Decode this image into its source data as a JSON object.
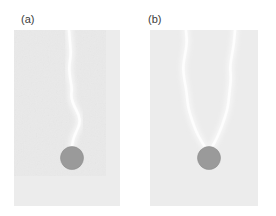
{
  "figure": {
    "width": 276,
    "height": 216,
    "background_color": "#ffffff"
  },
  "colors": {
    "page_background": "#ffffff",
    "specimen_body": "#ececec",
    "specimen_body_alt": "#e8e8e8",
    "crack_path": "#fdfdfd",
    "crack_glow": "#f6f6f6",
    "inclusion_fill": "#9a9a9a",
    "inclusion_edge": "#8f8f8f",
    "label_text": "#3a3a3a"
  },
  "panels": [
    {
      "id": "panel-a",
      "label": "(a)",
      "label_x": 21,
      "label_y": 14,
      "x": 14,
      "y": 30,
      "width": 106,
      "height": 176,
      "crack_count": 1,
      "inclusion": {
        "cx": 72,
        "cy": 158,
        "r": 11.5,
        "shape": "circle"
      },
      "cracks": [
        {
          "name": "primary-crack",
          "points": "69,30 70,42 71,55 69,66 70,78 72,88 71,97 74,106 79,115 80,124 76,132 73,140 72,146"
        }
      ]
    },
    {
      "id": "panel-b",
      "label": "(b)",
      "label_x": 148,
      "label_y": 14,
      "x": 150,
      "y": 30,
      "width": 108,
      "height": 176,
      "crack_count": 2,
      "inclusion": {
        "cx": 209,
        "cy": 158,
        "r": 11.5,
        "shape": "circle"
      },
      "cracks": [
        {
          "name": "left-crack",
          "points": "186,30 187,43 185,55 183,66 184,78 186,88 187,97 188,106 190,114 193,123 196,131 200,139 205,147"
        },
        {
          "name": "right-crack",
          "points": "235,30 234,43 232,55 230,66 231,78 230,88 229,97 228,106 226,114 223,123 220,131 216,140 212,147"
        }
      ]
    }
  ]
}
